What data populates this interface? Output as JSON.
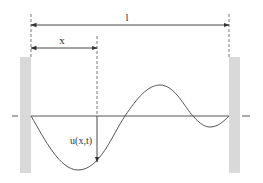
{
  "diagram": {
    "labels": {
      "length": "l",
      "position": "x",
      "displacement": "u(x,t)"
    },
    "colors": {
      "line": "#444444",
      "wall": "#d9d9d9",
      "curve": "#555555"
    }
  }
}
